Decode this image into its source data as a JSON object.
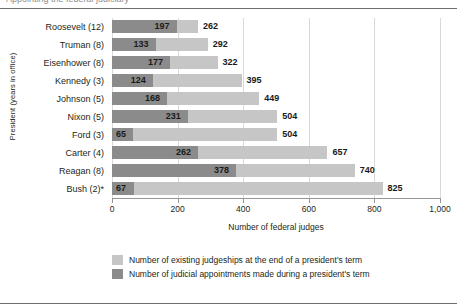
{
  "title_remnant": "Appointing the federal judiciary",
  "axis": {
    "y_title": "President (years in office)",
    "x_title": "Number of federal judges",
    "x_ticks": [
      "0",
      "200",
      "400",
      "600",
      "800",
      "1,000"
    ]
  },
  "legend": {
    "items": [
      {
        "label": "Number of existing judgeships at the end of a president's term",
        "color": "#c6c6c6",
        "name": "legend-existing-judgeships"
      },
      {
        "label": "Number of judicial appointments made during a president's term",
        "color": "#8b8b8b",
        "name": "legend-judicial-appointments"
      }
    ]
  },
  "chart_data": {
    "type": "bar",
    "title": "Appointing the federal judiciary",
    "xlabel": "Number of federal judges",
    "ylabel": "President (years in office)",
    "xlim": [
      0,
      1000
    ],
    "xticks": [
      0,
      200,
      400,
      600,
      800,
      1000
    ],
    "grid": true,
    "orientation": "horizontal",
    "legend_position": "bottom",
    "categories": [
      "Roosevelt (12)",
      "Truman (8)",
      "Eisenhower (8)",
      "Kennedy (3)",
      "Johnson (5)",
      "Nixon (5)",
      "Ford (3)",
      "Carter (4)",
      "Reagan (8)",
      "Bush (2)*"
    ],
    "series": [
      {
        "name": "Number of existing judgeships at the end of a president's term",
        "color": "#c6c6c6",
        "values": [
          262,
          292,
          322,
          395,
          449,
          504,
          504,
          657,
          740,
          825
        ]
      },
      {
        "name": "Number of judicial appointments made during a president's term",
        "color": "#8b8b8b",
        "values": [
          197,
          133,
          177,
          124,
          168,
          231,
          65,
          262,
          378,
          67
        ]
      }
    ]
  }
}
